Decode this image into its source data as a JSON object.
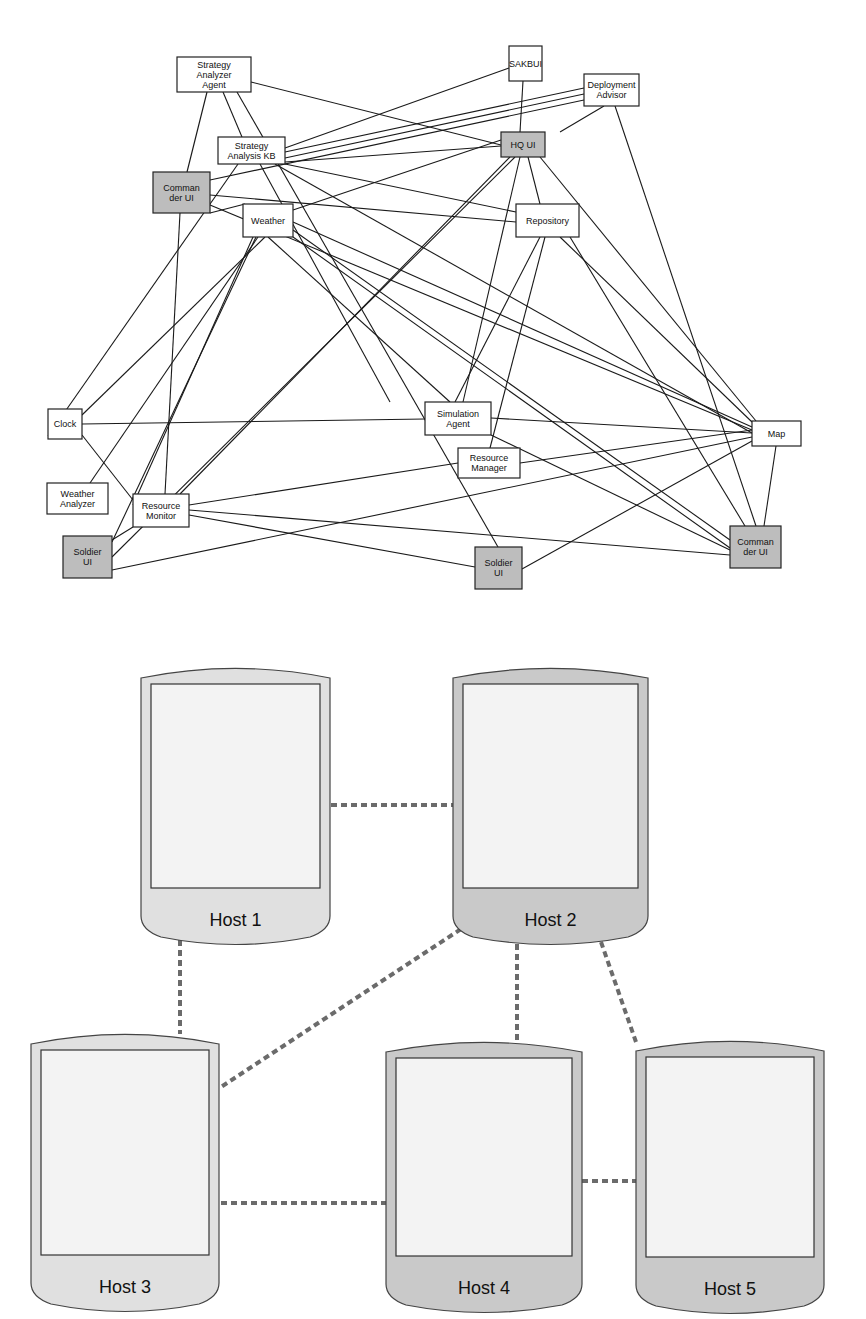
{
  "agent_graph": {
    "colors": {
      "node_fill": "#ffffff",
      "ui_node_fill": "#bdbdbd",
      "edge": "#1a1a1a"
    },
    "nodes": [
      {
        "id": "saa",
        "lines": [
          "Strategy",
          "Analyzer",
          "Agent"
        ],
        "x": 177,
        "y": 57,
        "w": 74,
        "h": 35,
        "ui": false
      },
      {
        "id": "sakbui",
        "lines": [
          "SAKBUI"
        ],
        "x": 509,
        "y": 46,
        "w": 33,
        "h": 35,
        "ui": false
      },
      {
        "id": "deploy",
        "lines": [
          "Deployment",
          "Advisor"
        ],
        "x": 584,
        "y": 74,
        "w": 55,
        "h": 32,
        "ui": false
      },
      {
        "id": "sakb",
        "lines": [
          "Strategy",
          "Analysis KB"
        ],
        "x": 218,
        "y": 137,
        "w": 67,
        "h": 27,
        "ui": false
      },
      {
        "id": "hqui",
        "lines": [
          "HQ UI"
        ],
        "x": 501,
        "y": 132,
        "w": 44,
        "h": 25,
        "ui": true
      },
      {
        "id": "cmdui_l",
        "lines": [
          "Comman",
          "der UI"
        ],
        "x": 153,
        "y": 172,
        "w": 57,
        "h": 41,
        "ui": true
      },
      {
        "id": "weather",
        "lines": [
          "Weather"
        ],
        "x": 243,
        "y": 204,
        "w": 50,
        "h": 33,
        "ui": false
      },
      {
        "id": "repo",
        "lines": [
          "Repository"
        ],
        "x": 516,
        "y": 204,
        "w": 63,
        "h": 33,
        "ui": false
      },
      {
        "id": "clock",
        "lines": [
          "Clock"
        ],
        "x": 48,
        "y": 409,
        "w": 34,
        "h": 30,
        "ui": false
      },
      {
        "id": "sim",
        "lines": [
          "Simulation",
          "Agent"
        ],
        "x": 425,
        "y": 402,
        "w": 66,
        "h": 33,
        "ui": false
      },
      {
        "id": "map",
        "lines": [
          "Map"
        ],
        "x": 752,
        "y": 421,
        "w": 49,
        "h": 25,
        "ui": false
      },
      {
        "id": "resmgr",
        "lines": [
          "Resource",
          "Manager"
        ],
        "x": 458,
        "y": 448,
        "w": 62,
        "h": 30,
        "ui": false
      },
      {
        "id": "wanalyzer",
        "lines": [
          "Weather",
          "Analyzer"
        ],
        "x": 47,
        "y": 483,
        "w": 61,
        "h": 31,
        "ui": false
      },
      {
        "id": "resmon",
        "lines": [
          "Resource",
          "Monitor"
        ],
        "x": 133,
        "y": 494,
        "w": 56,
        "h": 33,
        "ui": false
      },
      {
        "id": "soldier_l",
        "lines": [
          "Soldier",
          "UI"
        ],
        "x": 63,
        "y": 536,
        "w": 49,
        "h": 42,
        "ui": true
      },
      {
        "id": "soldier_c",
        "lines": [
          "Soldier",
          "UI"
        ],
        "x": 475,
        "y": 547,
        "w": 47,
        "h": 42,
        "ui": true
      },
      {
        "id": "cmdui_r",
        "lines": [
          "Comman",
          "der UI"
        ],
        "x": 730,
        "y": 526,
        "w": 51,
        "h": 42,
        "ui": true
      }
    ],
    "edges": [
      [
        207,
        92,
        187,
        172
      ],
      [
        223,
        92,
        242,
        137
      ],
      [
        237,
        92,
        498,
        547
      ],
      [
        251,
        82,
        501,
        145
      ],
      [
        285,
        148,
        509,
        68
      ],
      [
        285,
        152,
        584,
        88
      ],
      [
        285,
        158,
        584,
        94
      ],
      [
        285,
        162,
        501,
        146
      ],
      [
        285,
        164,
        516,
        212
      ],
      [
        275,
        164,
        752,
        433
      ],
      [
        260,
        164,
        390,
        402
      ],
      [
        238,
        164,
        48,
        436
      ],
      [
        210,
        180,
        584,
        100
      ],
      [
        210,
        195,
        516,
        222
      ],
      [
        210,
        205,
        752,
        430
      ],
      [
        180,
        213,
        165,
        494
      ],
      [
        210,
        213,
        245,
        204
      ],
      [
        293,
        210,
        501,
        140
      ],
      [
        265,
        237,
        82,
        415
      ],
      [
        258,
        237,
        90,
        483
      ],
      [
        256,
        237,
        112,
        542
      ],
      [
        253,
        237,
        133,
        505
      ],
      [
        268,
        237,
        450,
        402
      ],
      [
        293,
        222,
        752,
        427
      ],
      [
        293,
        230,
        730,
        540
      ],
      [
        293,
        237,
        730,
        548
      ],
      [
        523,
        81,
        520,
        132
      ],
      [
        604,
        106,
        560,
        132
      ],
      [
        615,
        106,
        756,
        526
      ],
      [
        510,
        157,
        180,
        494
      ],
      [
        515,
        157,
        112,
        557
      ],
      [
        520,
        157,
        463,
        402
      ],
      [
        528,
        157,
        540,
        204
      ],
      [
        540,
        157,
        756,
        421
      ],
      [
        540,
        237,
        455,
        402
      ],
      [
        545,
        237,
        490,
        448
      ],
      [
        560,
        237,
        752,
        422
      ],
      [
        570,
        237,
        745,
        526
      ],
      [
        82,
        424,
        425,
        419
      ],
      [
        82,
        435,
        133,
        500
      ],
      [
        491,
        418,
        752,
        433
      ],
      [
        491,
        435,
        730,
        550
      ],
      [
        520,
        463,
        752,
        430
      ],
      [
        458,
        463,
        189,
        505
      ],
      [
        522,
        569,
        752,
        441
      ],
      [
        112,
        570,
        752,
        437
      ],
      [
        189,
        510,
        730,
        555
      ],
      [
        189,
        515,
        475,
        567
      ],
      [
        133,
        527,
        112,
        540
      ],
      [
        776,
        446,
        764,
        526
      ]
    ]
  },
  "host_diagram": {
    "colors": {
      "host_light": "#e0e0e0",
      "host_dark": "#c9c9c9",
      "screen": "#f3f3f3",
      "link": "#6b6b6b"
    },
    "hosts": [
      {
        "id": "h1",
        "label": "Host 1",
        "x": 141,
        "y": 666,
        "w": 189,
        "h": 282,
        "shade": "light"
      },
      {
        "id": "h2",
        "label": "Host 2",
        "x": 453,
        "y": 666,
        "w": 195,
        "h": 282,
        "shade": "dark"
      },
      {
        "id": "h3",
        "label": "Host 3",
        "x": 31,
        "y": 1032,
        "w": 188,
        "h": 283,
        "shade": "light"
      },
      {
        "id": "h4",
        "label": "Host 4",
        "x": 386,
        "y": 1040,
        "w": 196,
        "h": 276,
        "shade": "dark"
      },
      {
        "id": "h5",
        "label": "Host 5",
        "x": 636,
        "y": 1039,
        "w": 188,
        "h": 278,
        "shade": "dark"
      }
    ],
    "links": [
      [
        331,
        805,
        453,
        805
      ],
      [
        180,
        940,
        180,
        1034
      ],
      [
        461,
        929,
        221,
        1087
      ],
      [
        517,
        944,
        517,
        1040
      ],
      [
        601,
        942,
        636,
        1042
      ],
      [
        221,
        1203,
        386,
        1203
      ],
      [
        582,
        1181,
        636,
        1181
      ]
    ]
  }
}
